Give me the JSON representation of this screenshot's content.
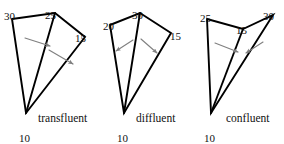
{
  "figure": {
    "background_color": "#ffffff",
    "line_color": "#000000",
    "arrow_color": "#808080",
    "text_color": "#111111",
    "width": 284,
    "height": 144
  },
  "diagrams": [
    {
      "id": "transfluent",
      "caption": "transfluent",
      "caption_pos": {
        "x": 38,
        "y": 122
      },
      "outline_points": "12,19 55,13 85,37 26,113 12,19",
      "inner_edge": "55,13 26,113",
      "vertex_labels": [
        {
          "name": "label-30",
          "text": "30",
          "x": 4,
          "y": 11
        },
        {
          "name": "label-25",
          "text": "25",
          "x": 45,
          "y": 10
        },
        {
          "name": "label-15",
          "text": "15",
          "x": 75,
          "y": 33
        },
        {
          "name": "label-10",
          "text": "10",
          "x": 19,
          "y": 133
        }
      ],
      "arrows": [
        {
          "name": "flow-arrow-left",
          "x1": 25,
          "y1": 38,
          "x2": 50,
          "y2": 46
        },
        {
          "name": "flow-arrow-right",
          "x1": 49,
          "y1": 50,
          "x2": 73,
          "y2": 64
        }
      ]
    },
    {
      "id": "diffluent",
      "caption": "diffluent",
      "caption_pos": {
        "x": 136,
        "y": 122
      },
      "outline_points": "110,25 140,13 171,33 124,113 110,25",
      "inner_edge": "140,13 124,113",
      "vertex_labels": [
        {
          "name": "label-20",
          "text": "20",
          "x": 103,
          "y": 21
        },
        {
          "name": "label-30",
          "text": "30",
          "x": 132,
          "y": 10
        },
        {
          "name": "label-15",
          "text": "15",
          "x": 170,
          "y": 31
        },
        {
          "name": "label-10",
          "text": "10",
          "x": 117,
          "y": 133
        }
      ],
      "arrows": [
        {
          "name": "flow-arrow-left",
          "x1": 133,
          "y1": 40,
          "x2": 116,
          "y2": 51
        },
        {
          "name": "flow-arrow-right",
          "x1": 141,
          "y1": 39,
          "x2": 157,
          "y2": 53
        }
      ]
    },
    {
      "id": "confluent",
      "caption": "confluent",
      "caption_pos": {
        "x": 226,
        "y": 122
      },
      "outline_points": "207,19 243,29 273,15 211,113 207,19",
      "inner_edge": "243,29 211,113",
      "vertex_labels": [
        {
          "name": "label-25",
          "text": "25",
          "x": 200,
          "y": 13
        },
        {
          "name": "label-15",
          "text": "15",
          "x": 236,
          "y": 25
        },
        {
          "name": "label-30",
          "text": "30",
          "x": 263,
          "y": 11
        },
        {
          "name": "label-10",
          "text": "10",
          "x": 204,
          "y": 133
        }
      ],
      "arrows": [
        {
          "name": "flow-arrow-left",
          "x1": 215,
          "y1": 43,
          "x2": 238,
          "y2": 52
        },
        {
          "name": "flow-arrow-right",
          "x1": 263,
          "y1": 42,
          "x2": 246,
          "y2": 53
        }
      ]
    }
  ]
}
